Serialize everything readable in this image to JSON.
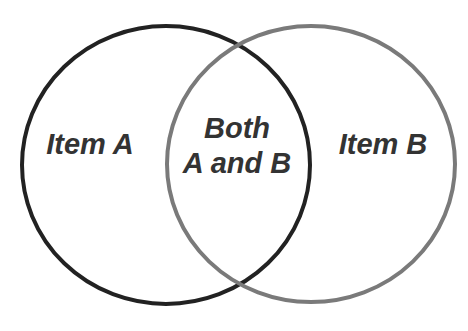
{
  "diagram": {
    "type": "venn",
    "sets": [
      {
        "id": "A",
        "label": "Item A",
        "stroke": "#222222"
      },
      {
        "id": "B",
        "label": "Item B",
        "stroke": "#7a7a7a"
      }
    ],
    "intersection": {
      "line1": "Both",
      "line2": "A and B"
    },
    "text_color": "#333333",
    "background": "#ffffff"
  }
}
